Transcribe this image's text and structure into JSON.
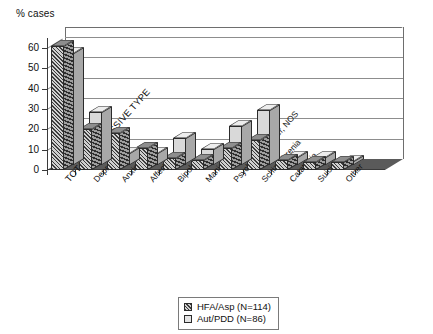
{
  "chart_data": {
    "type": "bar",
    "title": "",
    "xlabel": "",
    "ylabel": "% cases",
    "ylim": [
      0,
      65
    ],
    "yticks": [
      0,
      10,
      20,
      30,
      40,
      50,
      60
    ],
    "grid": true,
    "legend_position": "bottom-center",
    "categories": [
      "TOTAL DEPRESSIVE TYPE",
      "Depression",
      "Anxiety",
      "Affective",
      "Bipolar",
      "Mania",
      "Psychotic disorder, NOS",
      "Schizophrenia",
      "Catatonia",
      "Suicide",
      "Other"
    ],
    "series": [
      {
        "name": "HFA/Asp (N=114)",
        "values": [
          61,
          20,
          18,
          11,
          6,
          5,
          11,
          15,
          5,
          4,
          4
        ]
      },
      {
        "name": "Aut/PDD (N=86)",
        "values": [
          55,
          26,
          6,
          6,
          13,
          8,
          19,
          27,
          4,
          4,
          2
        ]
      }
    ]
  },
  "axis": {
    "y_title": "% cases",
    "y_tick_labels": [
      "0",
      "10",
      "20",
      "30",
      "40",
      "50",
      "60"
    ]
  },
  "legend": {
    "entries": [
      {
        "label": "HFA/Asp (N=114)",
        "swatch": "hatched-dark"
      },
      {
        "label": "Aut/PDD (N=86)",
        "swatch": "light-plain"
      }
    ]
  },
  "colors": {
    "series_a": "#3c3c3c",
    "series_b": "#d9d9d9",
    "axis": "#3a3a3a",
    "grid": "#8d8d8d",
    "floor": "#5a5a5a",
    "background": "#ffffff"
  }
}
